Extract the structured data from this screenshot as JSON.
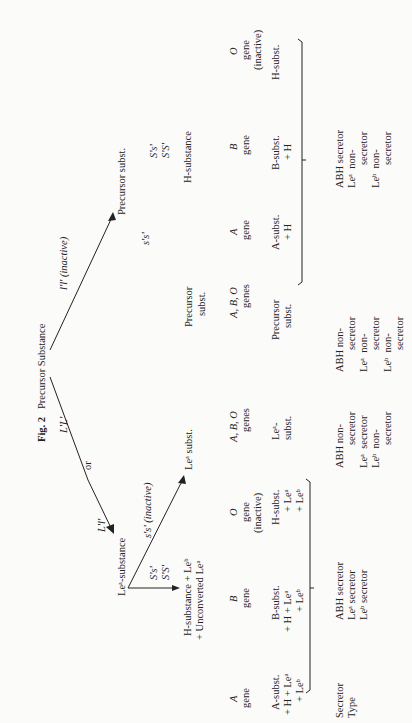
{
  "figure": {
    "label": "Fig. 2",
    "title": "Precursor Substance"
  },
  "branches": {
    "left_genotype": "L'L'",
    "or": "or",
    "right_genotype": "l'l' (inactive)",
    "left_left": "L'l'"
  },
  "nodes": {
    "lea_substance": "Leᵃ-substance",
    "lea_subst": "Leᵃ subst.",
    "precursor_subst_top": "Precursor subst.",
    "precursor_subst_mid": "Precursor\nsubst.",
    "h_substance_left_l1": "H-substance + Leᵇ",
    "h_substance_left_l2": "+ Unconverted Leᵃ",
    "h_substance_right": "H-substance"
  },
  "secretor_genes": {
    "left_active": [
      "S's'",
      "S'S'"
    ],
    "left_inactive": "s's' (inactive)",
    "right_inactive": "s's'",
    "right_active": [
      "S's'",
      "S'S'"
    ]
  },
  "gene_rows": {
    "left": [
      {
        "gene": "A",
        "label": "gene",
        "product": [
          "A-subst.",
          "+ H + Leᵃ",
          "+ Leᵇ"
        ]
      },
      {
        "gene": "B",
        "label": "gene",
        "product": [
          "B-subst.",
          "+ H + Leᵃ",
          "+ Leᵇ"
        ]
      },
      {
        "gene": "O",
        "label": "gene (inactive)",
        "product": [
          "H-subst.",
          "+ Leᵃ",
          "+ Leᵇ"
        ]
      }
    ],
    "mid_left": {
      "genes": "A, B, O",
      "label": "genes",
      "product": [
        "Leᵃ-",
        "subst."
      ]
    },
    "mid_right": {
      "genes": "A, B, O",
      "label": "genes",
      "product": [
        "Precursor",
        "subst."
      ]
    },
    "right": [
      {
        "gene": "A",
        "label": "gene",
        "product": [
          "A-subst.",
          "+ H"
        ]
      },
      {
        "gene": "B",
        "label": "gene",
        "product": [
          "B-subst.",
          "+ H"
        ]
      },
      {
        "gene": "O",
        "label": "gene (inactive)",
        "product": [
          "H-subst."
        ]
      }
    ]
  },
  "secretor_type": {
    "heading": [
      "Secretor",
      "Type"
    ],
    "left": [
      "ABH secretor",
      "Leᵃ secretor",
      "Leᵇ secretor"
    ],
    "mid_left": [
      "ABH non-secretor",
      "Leᵃ secretor",
      "Leᵇ non-secretor"
    ],
    "mid_right": [
      "ABH non-secretor",
      "Leᵃ non-secretor",
      "Leᵇ non-secretor"
    ],
    "right": [
      "ABH secretor",
      "Leᵃ non-secretor",
      "Leᵇ non-secretor"
    ]
  }
}
